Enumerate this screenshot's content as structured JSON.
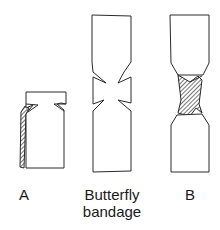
{
  "figure": {
    "panels": [
      {
        "id": "A",
        "label": "A",
        "description": "Bandage strip folded with partial adhesive strip on left edge (hatched)"
      },
      {
        "id": "butterfly",
        "label": "Butterfly bandage",
        "label_lines": [
          "Butterfly",
          "bandage"
        ],
        "description": "Unapplied butterfly bandage with two V-notches on each side of the narrow center"
      },
      {
        "id": "B",
        "label": "B",
        "description": "Butterfly bandage with center portion folded/twisted (hatched, non-adhesive)"
      }
    ],
    "colors": {
      "stroke": "#2a2a2a",
      "hatch": "#3a3a3a",
      "background": "#ffffff"
    }
  }
}
